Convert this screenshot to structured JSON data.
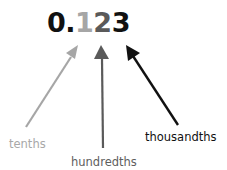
{
  "number": {
    "digits": [
      "0.",
      "1",
      "2",
      "3"
    ]
  },
  "labels": {
    "tenths": "tenths",
    "hundredths": "hundredths",
    "thousandths": "thousandths"
  },
  "colors": {
    "tenths": "#a6a6a6",
    "hundredths": "#5a5a5a",
    "thousandths": "#111111"
  }
}
